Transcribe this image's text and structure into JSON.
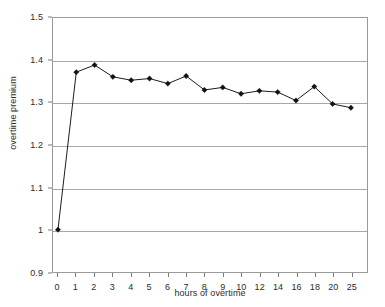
{
  "chart_data": {
    "type": "line",
    "title": "",
    "xlabel": "hours of overtime",
    "ylabel": "overtime premium",
    "categories": [
      "0",
      "1",
      "2",
      "3",
      "4",
      "5",
      "6",
      "7",
      "8",
      "9",
      "10",
      "12",
      "14",
      "16",
      "18",
      "20",
      "25"
    ],
    "values": [
      1.0,
      1.372,
      1.389,
      1.361,
      1.353,
      1.357,
      1.345,
      1.363,
      1.33,
      1.336,
      1.321,
      1.328,
      1.325,
      1.305,
      1.338,
      1.297,
      1.288
    ],
    "series": [
      {
        "name": "overtime premium",
        "values": [
          1.0,
          1.372,
          1.389,
          1.361,
          1.353,
          1.357,
          1.345,
          1.363,
          1.33,
          1.336,
          1.321,
          1.328,
          1.325,
          1.305,
          1.338,
          1.297,
          1.288
        ]
      }
    ],
    "ylim": [
      0.9,
      1.5
    ],
    "ytick_labels": [
      "1.5",
      "1.4",
      "1.3",
      "1.2",
      "1.1",
      "1",
      "0.9"
    ],
    "ytick_values": [
      1.5,
      1.4,
      1.3,
      1.2,
      1.1,
      1.0,
      0.9
    ],
    "grid": true,
    "grid_axis": "y",
    "legend": false,
    "legend_position": "none",
    "marker": "diamond",
    "line_color": "#1a1a1a",
    "marker_color": "#111111",
    "grid_color": "#a7a7a7",
    "axis_color": "#9a9a9a",
    "plot_background": "#ffffff"
  }
}
